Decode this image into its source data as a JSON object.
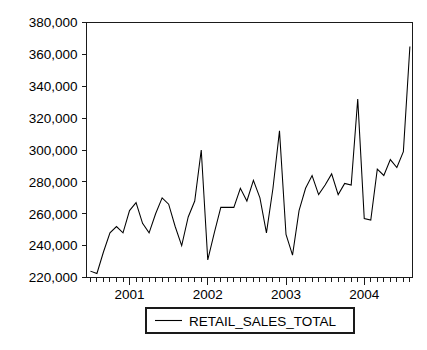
{
  "chart_data": {
    "type": "line",
    "title": "",
    "xlabel": "",
    "ylabel": "",
    "grid": false,
    "legend_position": "bottom-center",
    "ylim": [
      220000,
      380000
    ],
    "ytick_values": [
      220000,
      240000,
      260000,
      280000,
      300000,
      320000,
      340000,
      360000,
      380000
    ],
    "ytick_labels": [
      "220,000",
      "240,000",
      "260,000",
      "280,000",
      "300,000",
      "320,000",
      "340,000",
      "360,000",
      "380,000"
    ],
    "xtick_labels": [
      "2001",
      "2002",
      "2003",
      "2004"
    ],
    "xtick_positions": [
      12,
      24,
      36,
      48
    ],
    "x_minor_tick_interval_months": 1,
    "x_range_months": [
      6,
      54
    ],
    "series": [
      {
        "name": "RETAIL_SALES_TOTAL",
        "color": "#000000",
        "x": [
          6,
          7,
          8,
          9,
          10,
          11,
          12,
          13,
          14,
          15,
          16,
          17,
          18,
          19,
          20,
          21,
          22,
          23,
          24,
          25,
          26,
          27,
          28,
          29,
          30,
          31,
          32,
          33,
          34,
          35,
          36,
          37,
          38,
          39,
          40,
          41,
          42,
          43,
          44,
          45,
          46,
          47,
          48,
          49,
          50,
          51,
          52,
          53,
          54
        ],
        "x_labels": [
          "2000-07",
          "2000-08",
          "2000-09",
          "2000-10",
          "2000-11",
          "2000-12",
          "2001-01",
          "2001-02",
          "2001-03",
          "2001-04",
          "2001-05",
          "2001-06",
          "2001-07",
          "2001-08",
          "2001-09",
          "2001-10",
          "2001-11",
          "2001-12",
          "2002-01",
          "2002-02",
          "2002-03",
          "2002-04",
          "2002-05",
          "2002-06",
          "2002-07",
          "2002-08",
          "2002-09",
          "2002-10",
          "2002-11",
          "2002-12",
          "2003-01",
          "2003-02",
          "2003-03",
          "2003-04",
          "2003-05",
          "2003-06",
          "2003-07",
          "2003-08",
          "2003-09",
          "2003-10",
          "2003-11",
          "2003-12",
          "2004-01",
          "2004-02",
          "2004-03",
          "2004-04",
          "2004-05",
          "2004-06",
          "2004-07"
        ],
        "values": [
          224000,
          222500,
          236000,
          248000,
          252000,
          248000,
          262000,
          267000,
          254000,
          248000,
          260000,
          270000,
          266000,
          252000,
          240000,
          258000,
          268000,
          300000,
          231000,
          248000,
          264000,
          264000,
          264000,
          276000,
          268000,
          281000,
          270000,
          248000,
          276000,
          312000,
          247000,
          234000,
          262000,
          276000,
          284000,
          272000,
          278000,
          285000,
          272000,
          279000,
          278000,
          332000,
          257000,
          256000,
          288000,
          284000,
          294000,
          289000,
          299000
        ]
      }
    ],
    "extra_points": {
      "note": "final segment rises sharply to 365,000 at right edge",
      "tail_x": [
        49,
        50,
        51,
        52,
        53,
        54,
        55
      ],
      "tail_values": [
        256000,
        288000,
        284000,
        294000,
        289000,
        299000,
        365000
      ]
    }
  },
  "legend": {
    "entries": [
      {
        "label": "RETAIL_SALES_TOTAL",
        "color": "#000000"
      }
    ]
  }
}
